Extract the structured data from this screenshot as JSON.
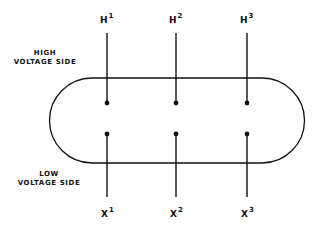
{
  "diagram": {
    "high_side_label": [
      "HIGH",
      "VOLTAGE SIDE"
    ],
    "low_side_label": [
      "LOW",
      "VOLTAGE SIDE"
    ],
    "high_terminals": [
      {
        "letter": "H",
        "index": "1"
      },
      {
        "letter": "H",
        "index": "2"
      },
      {
        "letter": "H",
        "index": "3"
      }
    ],
    "low_terminals": [
      {
        "letter": "X",
        "index": "1"
      },
      {
        "letter": "X",
        "index": "2"
      },
      {
        "letter": "X",
        "index": "3"
      }
    ],
    "line_color": "#111111"
  }
}
